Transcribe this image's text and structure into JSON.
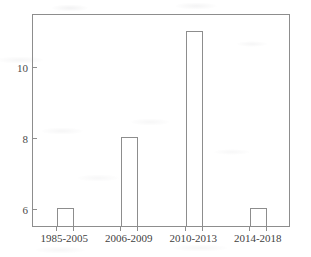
{
  "chart_data": {
    "type": "bar",
    "title": "",
    "subtitle": "",
    "xlabel": "",
    "ylabel": "",
    "categories": [
      "1985-2005",
      "2006-2009",
      "2010-2013",
      "2014-2018"
    ],
    "values": [
      6,
      8,
      11,
      6
    ],
    "ylim": [
      5.5,
      11.5
    ],
    "xlim": [
      0,
      4
    ],
    "yticks": [
      6,
      8,
      10
    ],
    "ytick_labels": [
      "6",
      "8",
      "10"
    ],
    "xtick_labels": [
      "1985-2005",
      "2006-2009",
      "2010-2013",
      "2014-2018"
    ],
    "grid": false,
    "legend": null,
    "legend_position": "none",
    "bar_style": "outline",
    "bar_fill": "#ffffff",
    "bar_stroke": "#8d8d8d",
    "axis_color": "#8d8d8d",
    "text_color": "#4a4a4a",
    "background": "#ffffff",
    "annotations": []
  },
  "axes": {
    "y": {
      "ticks": [
        {
          "label": "10",
          "value": 10
        },
        {
          "label": "8",
          "value": 8
        },
        {
          "label": "6",
          "value": 6
        }
      ]
    },
    "x": {
      "ticks": [
        {
          "label": "1985-2005",
          "value": 6
        },
        {
          "label": "2006-2009",
          "value": 8
        },
        {
          "label": "2010-2013",
          "value": 11
        },
        {
          "label": "2014-2018",
          "value": 6
        }
      ]
    }
  }
}
